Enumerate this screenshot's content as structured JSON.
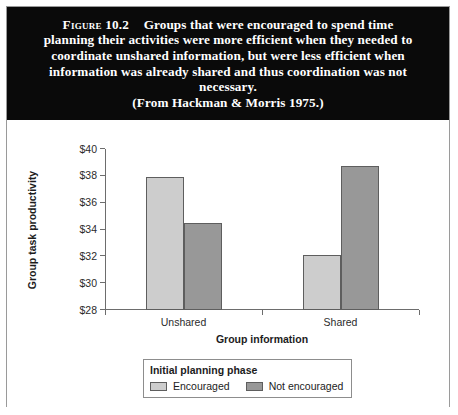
{
  "caption": {
    "figure_label": "Figure",
    "figure_number": "10.2",
    "body": "Groups that were encouraged to spend time planning their activities were more efficient when they needed to coordinate unshared information, but were less efficient when information was already shared and thus coordination was not necessary.",
    "source": "(From Hackman & Morris 1975.)"
  },
  "chart_data": {
    "type": "bar",
    "title": "",
    "xlabel": "Group information",
    "ylabel": "Group task productivity",
    "categories": [
      "Unshared",
      "Shared"
    ],
    "series": [
      {
        "name": "Encouraged",
        "values": [
          37.9,
          32.1
        ],
        "color": "#cdcdcd"
      },
      {
        "name": "Not encouraged",
        "values": [
          34.5,
          38.7
        ],
        "color": "#989898"
      }
    ],
    "ylim": [
      28,
      40
    ],
    "ytick_step": 2,
    "ytick_labels": [
      "$40",
      "$38",
      "$36",
      "$34",
      "$32",
      "$30",
      "$28"
    ],
    "ytick_values": [
      40,
      38,
      36,
      34,
      32,
      30,
      28
    ],
    "grid": false,
    "legend_position": "bottom",
    "legend_title": "Initial planning phase"
  }
}
